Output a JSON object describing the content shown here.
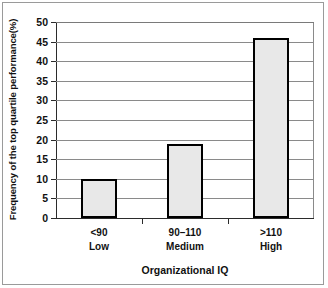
{
  "chart_data": {
    "type": "bar",
    "title": "",
    "subtitle": "",
    "categories": [
      "<90\nLow",
      "90–110\nMedium",
      ">110\nHigh"
    ],
    "category_lines": [
      [
        "<90",
        "Low"
      ],
      [
        "90–110",
        "Medium"
      ],
      [
        ">110",
        "High"
      ]
    ],
    "values": [
      10,
      19,
      46
    ],
    "xlabel": "Organizational IQ",
    "ylabel": "Frequency of the top quartile  performance(%)",
    "ylim": [
      0,
      50
    ],
    "yticks": [
      0,
      5,
      10,
      15,
      20,
      25,
      30,
      35,
      40,
      45,
      50
    ],
    "ytick_labels": [
      "0",
      "5",
      "10",
      "15",
      "20",
      "25",
      "30",
      "35",
      "40",
      "45",
      "50"
    ],
    "grid": true,
    "grid_axis": "y",
    "legend": false,
    "legend_position": "none",
    "bar_fill_color": "#e8e8e8",
    "bar_edge_color": "#000000",
    "gridline_color": "#8a8a8a",
    "axis_color": "#2b2b2b",
    "background_color": "#ffffff"
  }
}
